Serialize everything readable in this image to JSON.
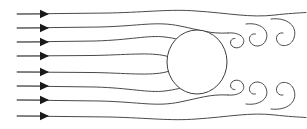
{
  "figure": {
    "title": "",
    "type": "fluid-flow-streamline-diagram",
    "background_color": "#ffffff",
    "line_color": "#4a4a4a",
    "arrow_color": "#1a1a1a",
    "cylinder_stroke_color": "#3d3d3d",
    "cylinder_fill_color": "#ffffff",
    "width": 307,
    "height": 129
  },
  "cylinder": {
    "label": "cylinder",
    "center_x": 197,
    "center_y": 62,
    "radius_x": 30,
    "radius_y": 32
  },
  "inlet": {
    "label": "uniform inflow",
    "line_count": 8,
    "start_x": 17,
    "arrow_x": 40,
    "lines": [
      {
        "y": 14,
        "arrow_y": 14
      },
      {
        "y": 28,
        "arrow_y": 28
      },
      {
        "y": 42,
        "arrow_y": 42
      },
      {
        "y": 56,
        "arrow_y": 56
      },
      {
        "y": 72,
        "arrow_y": 72
      },
      {
        "y": 86,
        "arrow_y": 86
      },
      {
        "y": 100,
        "arrow_y": 100
      },
      {
        "y": 116,
        "arrow_y": 116
      }
    ],
    "arrow_half_height": 4.2,
    "arrow_length": 9
  },
  "streamlines": {
    "label": "streamlines",
    "paths": [
      "M17,14 L110,13 C150,12 170,9 196,11 C228,13 250,18 275,15 C288,13.5 298,13 306,12.5",
      "M17,28 L100,27 C140,26 156,21 180,26 C200,30 210,34 228,33",
      "M17,42 L95,41 C130,40 148,35 165,37 C176,38.5 182,40 186,42",
      "M17,56 L92,55.5 C125,55 150,52 166,56 C172,57.5 176,59 178,61",
      "M17,72 L92,72.5 C125,73 150,76 166,72 C172,70.5 176,69 178,67",
      "M17,86 L95,87 C130,88 148,93 165,91 C176,89.5 182,88 186,86",
      "M17,100 L100,101 C140,102 156,107 180,102 C200,98 210,94 228,95",
      "M17,116 L110,117 C150,118 170,121 196,119 C228,117 250,112 275,115 C288,116.5 298,117 306,117.5"
    ]
  },
  "wake": {
    "label": "vortex wake hooks",
    "upper_hooks": [
      "M228,33 C240,32 246,38 243,44 C240.5,49 233,49 231,44.5 C229.5,41 232,38 235,38.5",
      "M246,24 C260,22 270,30 266,40 C263,47.5 253,48 250,41.5 C248,37 251.5,33 255.5,34",
      "M271,19 C287,17 298,26 294,38 C291,47 280,48 277,41 C275,36 279,32 283,33"
    ],
    "lower_hooks": [
      "M228,95 C240,96 246,90 243,84 C240.5,79 233,79 231,83.5 C229.5,87 232,90 235,89.5",
      "M246,104 C260,106 270,98 266,88 C263,80.5 253,80 250,86.5 C248,91 251.5,95 255.5,94",
      "M271,109 C287,111 298,102 294,90 C291,81 280,80 277,87 C275,92 279,96 283,95"
    ]
  },
  "arrows": {
    "label": "flow direction arrowheads",
    "direction": "right",
    "count": 8
  }
}
